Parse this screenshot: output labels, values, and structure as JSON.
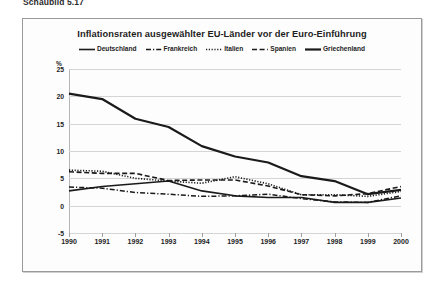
{
  "figure": {
    "caption": "Schaubild 5.17"
  },
  "chart_data": {
    "type": "line",
    "title": "Inflationsraten ausgewählter EU-Länder vor der Euro-Einführung",
    "xlabel": "",
    "ylabel": "%",
    "y_unit": "%",
    "grid": true,
    "legend_position": "top",
    "categories": [
      "1990",
      "1991",
      "1992",
      "1993",
      "1994",
      "1995",
      "1996",
      "1997",
      "1998",
      "1999",
      "2000"
    ],
    "x": [
      1990,
      1991,
      1992,
      1993,
      1994,
      1995,
      1996,
      1997,
      1998,
      1999,
      2000
    ],
    "xlim": [
      1990,
      2000
    ],
    "ylim": [
      -5,
      25
    ],
    "yticks": [
      25,
      20,
      15,
      10,
      5,
      0,
      -5
    ],
    "ytick_labels": [
      "25",
      "20",
      "15",
      "10",
      "5",
      "0",
      "-5"
    ],
    "series": [
      {
        "name": "Deutschland",
        "style": "solid",
        "color": "#1a1a1a",
        "values": [
          2.7,
          3.5,
          4.0,
          4.5,
          2.7,
          1.8,
          1.5,
          1.5,
          0.6,
          0.6,
          1.4
        ]
      },
      {
        "name": "Frankreich",
        "style": "dash-dot",
        "color": "#1a1a1a",
        "values": [
          3.4,
          3.2,
          2.4,
          2.1,
          1.7,
          1.8,
          2.1,
          1.3,
          0.7,
          0.6,
          1.8
        ]
      },
      {
        "name": "Italien",
        "style": "dotted",
        "color": "#1a1a1a",
        "values": [
          6.5,
          6.3,
          5.0,
          4.5,
          4.1,
          5.3,
          4.0,
          2.0,
          2.0,
          1.7,
          2.6
        ]
      },
      {
        "name": "Spanien",
        "style": "dashed",
        "color": "#1a1a1a",
        "values": [
          6.2,
          5.9,
          5.9,
          4.6,
          4.7,
          4.7,
          3.6,
          2.0,
          1.8,
          2.2,
          3.5
        ]
      },
      {
        "name": "Griechenland",
        "style": "solid-thick",
        "color": "#1a1a1a",
        "values": [
          20.5,
          19.5,
          15.9,
          14.4,
          10.9,
          9.0,
          7.9,
          5.4,
          4.5,
          2.1,
          2.9
        ]
      }
    ]
  }
}
